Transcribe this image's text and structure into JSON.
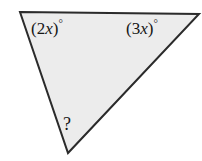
{
  "figure": {
    "type": "triangle-angle-diagram",
    "background_color": "#ffffff",
    "fill_color": "#ececec",
    "stroke_color": "#2b2b2b",
    "stroke_width": 2,
    "width": 202,
    "height": 161,
    "vertices": {
      "top_left": [
        20,
        12
      ],
      "top_right": [
        199,
        14
      ],
      "bottom": [
        68,
        153
      ]
    },
    "polygon_points": "20,12 199,14 68,153"
  },
  "labels": {
    "left_angle": {
      "open_paren": "(",
      "coefficient": "2",
      "variable": "x",
      "close_paren": ")",
      "degree": "°",
      "full_text": "(2x)°"
    },
    "right_angle": {
      "open_paren": "(",
      "coefficient": "3",
      "variable": "x",
      "close_paren": ")",
      "degree": "°",
      "full_text": "(3x)°"
    },
    "unknown_angle": {
      "full_text": "?"
    }
  }
}
